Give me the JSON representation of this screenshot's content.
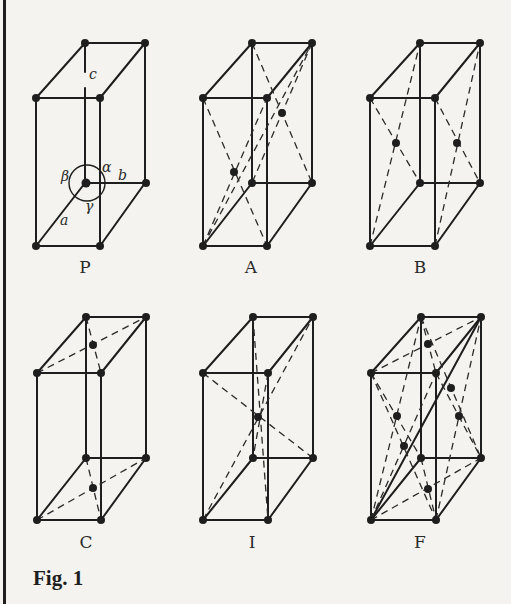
{
  "figure": {
    "caption": "Fig. 1",
    "lattice_types": [
      {
        "label": "P",
        "name": "primitive"
      },
      {
        "label": "A",
        "name": "A-face centered"
      },
      {
        "label": "B",
        "name": "B-face centered"
      },
      {
        "label": "C",
        "name": "C-face centered"
      },
      {
        "label": "I",
        "name": "body centered"
      },
      {
        "label": "F",
        "name": "face centered"
      }
    ],
    "cell_parameters": {
      "edges": [
        "a",
        "b",
        "c"
      ],
      "angles": [
        "α",
        "β",
        "γ"
      ]
    }
  },
  "colors": {
    "background": "#f4f3ef",
    "ink": "#1e1e1e"
  }
}
